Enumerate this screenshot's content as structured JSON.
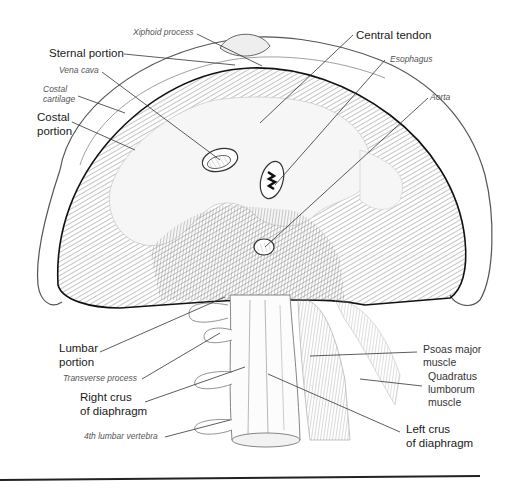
{
  "diagram": {
    "labels": {
      "xiphoid_process": "Xiphoid process",
      "sternal_portion": "Sternal portion",
      "vena_cava": "Vena cava",
      "costal_cartilage_1": "Costal",
      "costal_cartilage_2": "cartilage",
      "costal_portion_1": "Costal",
      "costal_portion_2": "portion",
      "central_tendon": "Central tendon",
      "esophagus": "Esophagus",
      "aorta": "Aorta",
      "lumbar_portion_1": "Lumbar",
      "lumbar_portion_2": "portion",
      "transverse_process": "Transverse process",
      "right_crus_1": "Right crus",
      "right_crus_2": "of diaphragm",
      "fourth_lumbar_vertebra": "4th lumbar vertebra",
      "psoas_major_1": "Psoas major",
      "psoas_major_2": "muscle",
      "quadratus_1": "Quadratus",
      "quadratus_2": "lumborum",
      "quadratus_3": "muscle",
      "left_crus_1": "Left crus",
      "left_crus_2": "of diaphragm"
    },
    "colors": {
      "ink": "#222222",
      "muscle": "#b8b8b8",
      "tendon": "#f4f4f4",
      "leader": "#333333"
    }
  }
}
